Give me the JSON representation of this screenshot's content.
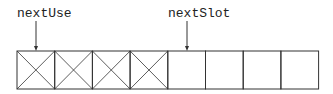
{
  "pointers": [
    {
      "label": "nextUse",
      "x": 17,
      "arrow_x": 36,
      "target_index": 0
    },
    {
      "label": "nextSlot",
      "x": 168,
      "arrow_x": 187,
      "target_index": 4
    }
  ],
  "array": {
    "cell_count": 8,
    "used_cells": [
      0,
      1,
      2,
      3
    ],
    "x": 17,
    "y": 51,
    "cell_width": 37.7,
    "cell_height": 38
  },
  "colors": {
    "stroke": "#333333",
    "text": "#222222"
  }
}
